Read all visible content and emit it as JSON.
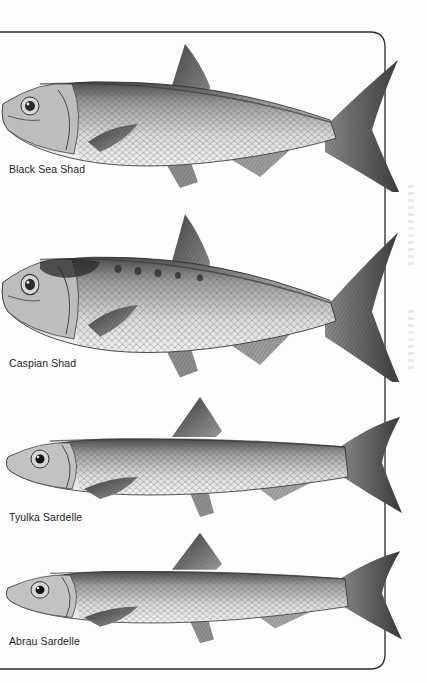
{
  "page": {
    "background": "#fdfdfd",
    "frame_color": "#2a2a2a",
    "ink_color": "#1e1e1e"
  },
  "plates": [
    {
      "label": "Black Sea Shad",
      "top": 42,
      "label_top": 163,
      "body_tone": "#b9b9b9",
      "spots": false
    },
    {
      "label": "Caspian Shad",
      "top": 210,
      "label_top": 357,
      "body_tone": "#a9a9a9",
      "spots": true
    },
    {
      "label": "Tyulka Sardelle",
      "top": 392,
      "label_top": 511,
      "body_tone": "#c2c2c2",
      "spots": false
    },
    {
      "label": "Abrau Sardelle",
      "top": 530,
      "label_top": 635,
      "body_tone": "#c6c6c6",
      "spots": false
    }
  ]
}
